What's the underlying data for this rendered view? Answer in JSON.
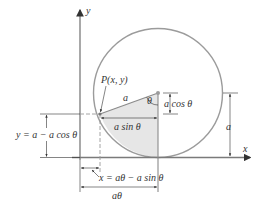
{
  "diagram": {
    "axes": {
      "x_label": "x",
      "y_label": "y"
    },
    "point_label": "P(x, y)",
    "radius_label": "a",
    "angle_label": "θ",
    "labels": {
      "a_cos_theta": "a cos θ",
      "a_sin_theta": "a sin θ",
      "right_radius": "a",
      "y_equation": "y = a − a cos θ",
      "x_equation": "x = aθ − a sin θ",
      "arc_length": "aθ"
    },
    "colors": {
      "circle": "#9b9b9b",
      "shaded_sector": "#e6e6e6",
      "axis": "#7a7a7a",
      "text": "#333333",
      "center_dot": "#9b9b9b"
    }
  }
}
